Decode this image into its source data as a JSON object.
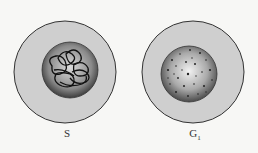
{
  "figure": {
    "cells": [
      {
        "id": "s-phase-cell",
        "label": "S",
        "label_sub": "",
        "nucleus": "condensing-chromatin-tangle"
      },
      {
        "id": "g1-phase-cell",
        "label": "G",
        "label_sub": "1",
        "nucleus": "dispersed-chromatin-dots"
      }
    ],
    "colors": {
      "background": "#f7f7f5",
      "cytoplasm": "#cfcfcf",
      "outline": "#333333",
      "nucleus_dark": "#555555",
      "nucleus_light": "#e6e6e6"
    }
  }
}
